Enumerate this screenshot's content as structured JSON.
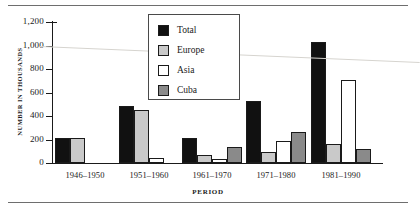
{
  "figure": {
    "y_axis_title": "NUMBER IN THOUSANDS",
    "x_axis_title": "PERIOD"
  },
  "legend": {
    "items": [
      {
        "label": "Total",
        "color": "#111111"
      },
      {
        "label": "Europe",
        "color": "#c9c9c9"
      },
      {
        "label": "Asia",
        "color": "#ffffff"
      },
      {
        "label": "Cuba",
        "color": "#8a8a8a"
      }
    ]
  },
  "axis": {
    "y_ticks": [
      "1,200",
      "1,000",
      "800",
      "600",
      "400",
      "200",
      "0"
    ]
  },
  "chart_data": {
    "type": "bar",
    "title": "",
    "xlabel": "PERIOD",
    "ylabel": "NUMBER IN THOUSANDS",
    "ylim": [
      0,
      1200
    ],
    "ytick_values": [
      0,
      200,
      400,
      600,
      800,
      1000,
      1200
    ],
    "ytick_labels": [
      "0",
      "200",
      "400",
      "600",
      "800",
      "1,000",
      "1,200"
    ],
    "grid": false,
    "legend_position": "upper-center",
    "categories": [
      "1946–1950",
      "1951–1960",
      "1961–1970",
      "1971–1980",
      "1981–1990"
    ],
    "series": [
      {
        "name": "Total",
        "color": "#111111",
        "values": [
          210,
          485,
          215,
          530,
          1030
        ]
      },
      {
        "name": "Europe",
        "color": "#c9c9c9",
        "values": [
          215,
          455,
          65,
          90,
          160
        ]
      },
      {
        "name": "Asia",
        "color": "#ffffff",
        "values": [
          0,
          40,
          30,
          190,
          710
        ]
      },
      {
        "name": "Cuba",
        "color": "#8a8a8a",
        "values": [
          0,
          0,
          135,
          260,
          115
        ]
      }
    ]
  }
}
